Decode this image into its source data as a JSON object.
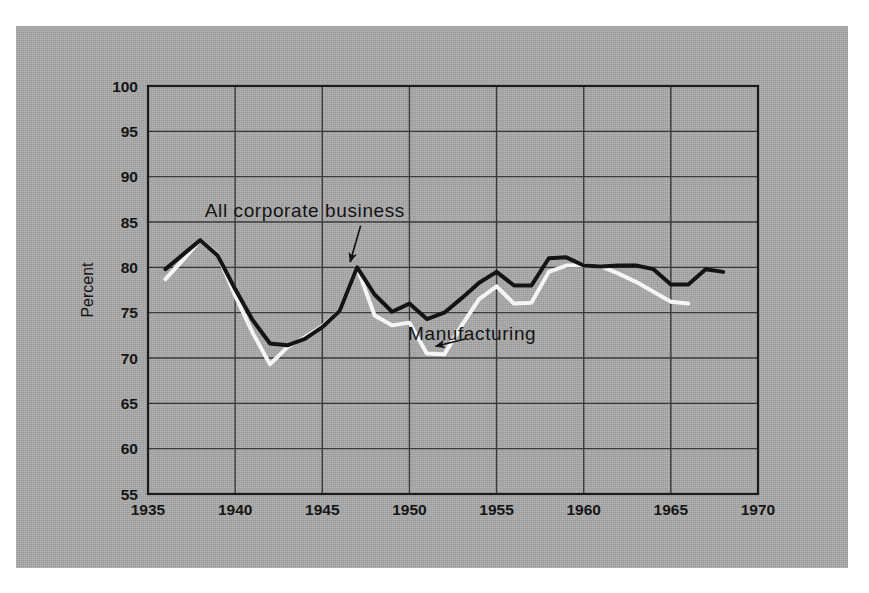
{
  "figure": {
    "background_color": "#ffffff",
    "panel_color": "#a9a9a9",
    "axis_color": "#1a1a1a",
    "grid_color": "#3a3a3a"
  },
  "chart_data": {
    "type": "line",
    "title": "",
    "xlabel": "",
    "ylabel": "Percent",
    "xlim": [
      1935,
      1970
    ],
    "ylim": [
      55,
      100
    ],
    "xticks": [
      1935,
      1940,
      1945,
      1950,
      1955,
      1960,
      1965,
      1970
    ],
    "yticks": [
      55,
      60,
      65,
      70,
      75,
      80,
      85,
      90,
      95,
      100
    ],
    "xtick_labels": [
      "1935",
      "1940",
      "1945",
      "1950",
      "1955",
      "1960",
      "1965",
      "1970"
    ],
    "ytick_labels": [
      "55",
      "60",
      "65",
      "70",
      "75",
      "80",
      "85",
      "90",
      "95",
      "100"
    ],
    "grid": true,
    "legend": "annotated",
    "series": [
      {
        "name": "All corporate business",
        "color": "#141414",
        "line_width": 4.0,
        "x": [
          1936,
          1937,
          1938,
          1939,
          1940,
          1941,
          1942,
          1943,
          1944,
          1945,
          1946,
          1947,
          1948,
          1949,
          1950,
          1951,
          1952,
          1953,
          1954,
          1955,
          1956,
          1957,
          1958,
          1959,
          1960,
          1961,
          1962,
          1963,
          1964,
          1965,
          1966,
          1967,
          1968
        ],
        "y": [
          79.8,
          81.4,
          83.0,
          81.3,
          77.6,
          74.2,
          71.6,
          71.4,
          72.1,
          73.4,
          75.2,
          80.0,
          77.0,
          75.1,
          76.0,
          74.3,
          75.0,
          76.6,
          78.3,
          79.5,
          78.0,
          78.0,
          81.0,
          81.1,
          80.2,
          80.1,
          80.2,
          80.2,
          79.8,
          78.1,
          78.1,
          79.8,
          79.5
        ]
      },
      {
        "name": "Manufacturing",
        "color": "#f5f5f5",
        "line_width": 4.0,
        "x": [
          1936,
          1937,
          1938,
          1939,
          1940,
          1941,
          1942,
          1943,
          1944,
          1945,
          1946,
          1947,
          1948,
          1949,
          1950,
          1951,
          1952,
          1953,
          1954,
          1955,
          1956,
          1957,
          1958,
          1959,
          1960,
          1961,
          1962,
          1963,
          1964,
          1965,
          1966
        ],
        "y": [
          78.7,
          80.8,
          83.0,
          81.4,
          76.9,
          72.8,
          69.3,
          71.2,
          72.3,
          73.5,
          75.2,
          80.0,
          74.7,
          73.6,
          73.9,
          70.5,
          70.4,
          73.6,
          76.5,
          77.9,
          76.0,
          76.1,
          79.5,
          80.2,
          80.2,
          80.1,
          79.3,
          78.4,
          77.3,
          76.2,
          76.0
        ]
      }
    ],
    "annotations": [
      {
        "text": "All corporate business",
        "text_x": 1944.0,
        "text_y": 86.2,
        "arrow_from_x": 1947.2,
        "arrow_from_y": 84.6,
        "arrow_to_x": 1946.6,
        "arrow_to_y": 80.6,
        "target_series": "All corporate business"
      },
      {
        "text": "Manufacturing",
        "text_x": 1953.6,
        "text_y": 72.6,
        "arrow_from_x": 1953.2,
        "arrow_from_y": 72.1,
        "arrow_to_x": 1951.5,
        "arrow_to_y": 71.3,
        "target_series": "Manufacturing"
      }
    ]
  }
}
